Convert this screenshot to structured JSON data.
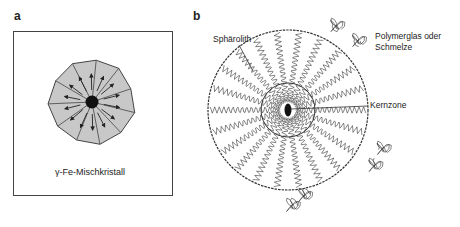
{
  "panels": {
    "a": {
      "label": "a",
      "caption": "γ-Fe-Mischkristall"
    },
    "b": {
      "label": "b",
      "labels": {
        "spherulite": "Sphärolith",
        "polymer_line1": "Polymerglas oder",
        "polymer_line2": "Schmelze",
        "core": "Kernzone"
      }
    }
  },
  "colors": {
    "stroke": "#333333",
    "fill_gray": "#c8c8c8",
    "nucleus": "#111111"
  }
}
